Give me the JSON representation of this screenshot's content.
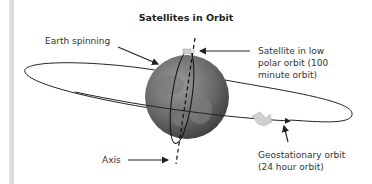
{
  "title": "Satellites in Orbit",
  "labels": {
    "earth_spinning": "Earth spinning",
    "low_polar_line1": "Satellite in low",
    "low_polar_line2": "polar orbit (100",
    "low_polar_line3": "minute orbit)",
    "axis": "Axis",
    "geo_line1": "Geostationary orbit",
    "geo_line2": "(24 hour orbit)"
  },
  "colors": {
    "earth": "#6e6e6e",
    "line": "#222222",
    "background": "#ffffff"
  }
}
